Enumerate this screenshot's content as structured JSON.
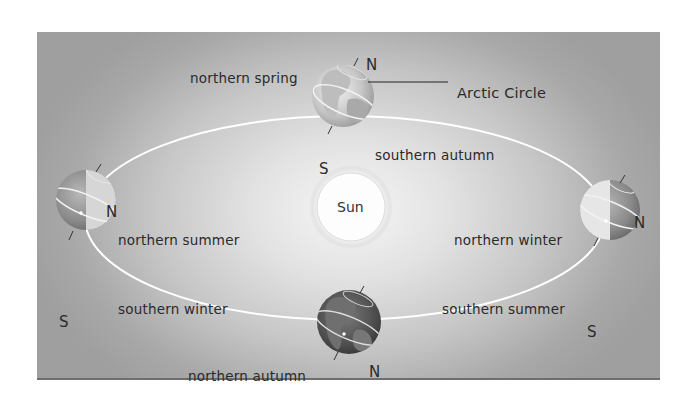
{
  "diagram": {
    "center_body": "Sun",
    "annotation": "Arctic Circle",
    "pole_labels": {
      "north": "N",
      "south": "S"
    },
    "positions": [
      {
        "id": "top",
        "northern": "northern spring",
        "southern": "southern autumn"
      },
      {
        "id": "left",
        "northern": "northern summer",
        "southern": "southern winter"
      },
      {
        "id": "right",
        "northern": "northern winter",
        "southern": "southern summer"
      },
      {
        "id": "bottom",
        "northern": "northern autumn",
        "southern": "southern spring"
      }
    ],
    "colors": {
      "background_center": "#f6f6f6",
      "background_edge": "#9f9f9f",
      "orbit": "#ffffff",
      "text": "#2a2a2a"
    }
  }
}
